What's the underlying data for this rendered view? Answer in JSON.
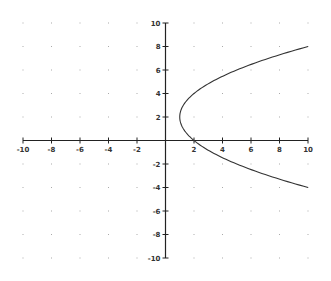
{
  "chart_data": {
    "type": "line",
    "title": "",
    "xlabel": "",
    "ylabel": "",
    "xlim": [
      -10,
      10
    ],
    "ylim": [
      -10,
      10
    ],
    "grid": "dots",
    "legend": null,
    "x_ticks": [
      "-10",
      "-8",
      "-6",
      "-4",
      "-2",
      "2",
      "4",
      "6",
      "8",
      "10"
    ],
    "y_ticks": [
      "10",
      "8",
      "6",
      "4",
      "2",
      "-2",
      "-4",
      "-6",
      "-8",
      "-10"
    ],
    "series": [
      {
        "name": "x = (y - 2)^2 / 4 + 1",
        "equation": "(y-2)^2 = 4(x-1)",
        "vertex": [
          1,
          2
        ],
        "points": [
          [
            10,
            8
          ],
          [
            7.25,
            7
          ],
          [
            5,
            6
          ],
          [
            3.25,
            5
          ],
          [
            2,
            4
          ],
          [
            1.25,
            3
          ],
          [
            1,
            2
          ],
          [
            1.25,
            1
          ],
          [
            2,
            0
          ],
          [
            3.25,
            -1
          ],
          [
            5,
            -2
          ],
          [
            7.25,
            -3
          ],
          [
            10,
            -4
          ]
        ]
      }
    ]
  },
  "colors": {
    "axis": "#222222",
    "curve": "#333333",
    "grid_dot": "#aaaaaa",
    "background": "#ffffff"
  }
}
